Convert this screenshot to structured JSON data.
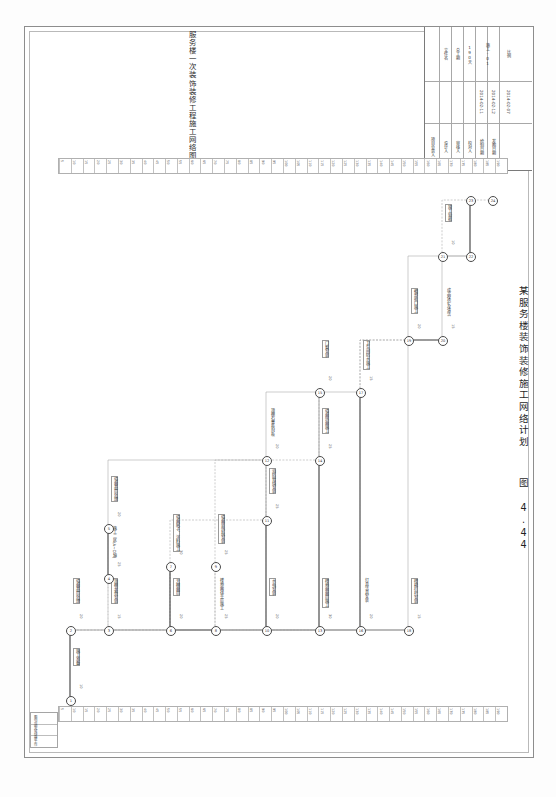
{
  "sheet": {
    "title": "服务楼一次装饰装修工程施工网络图",
    "figure_caption": "某服务楼装饰装修施工网络计划",
    "figure_number": "图 4.44"
  },
  "title_block": {
    "rows": [
      {
        "label": "项目负责人",
        "value": ""
      },
      {
        "label": "设计人",
        "value": ""
      },
      {
        "label": "审核人",
        "value": ""
      },
      {
        "label": "校对人",
        "value": ""
      },
      {
        "label": "绘制日期",
        "value": "2014-02-11"
      },
      {
        "label": "发图日期",
        "value": "2014-02-12"
      }
    ],
    "fields": [
      {
        "label": "文件名",
        "value": ""
      },
      {
        "label": "总工期",
        "value": "190天"
      },
      {
        "label": "比例",
        "value": ""
      },
      {
        "label": "图号",
        "value": "施工-01"
      }
    ],
    "date_note": "2014-02-07"
  },
  "rulers": {
    "top_labels": [
      "5",
      "10",
      "15",
      "20",
      "25",
      "30",
      "35",
      "40",
      "45",
      "50",
      "55",
      "60",
      "65",
      "70",
      "75",
      "80",
      "85",
      "90",
      "95",
      "100",
      "105",
      "110",
      "115",
      "120",
      "125",
      "130",
      "135",
      "140",
      "145",
      "150",
      "155",
      "160",
      "165",
      "170",
      "175",
      "180",
      "185",
      "190"
    ],
    "bottom_labels": [
      "5",
      "10",
      "15",
      "20",
      "25",
      "30",
      "35",
      "40",
      "45",
      "50",
      "55",
      "60",
      "65",
      "70",
      "75",
      "80",
      "85",
      "90",
      "95",
      "100",
      "105",
      "110",
      "115",
      "120",
      "125",
      "130",
      "135",
      "140",
      "145",
      "150",
      "155",
      "160",
      "165",
      "170",
      "175",
      "180",
      "185",
      "190"
    ]
  },
  "legend": {
    "rows": [
      "图例说明",
      "关键线路",
      "虚工作"
    ]
  },
  "chart_data": {
    "type": "diagram",
    "diagram_kind": "construction-network-cpm",
    "title": "服务楼一次装饰装修工程施工网络图",
    "total_duration_days": 190,
    "nodes": [
      {
        "id": "1",
        "x": 40,
        "y": 540
      },
      {
        "id": "2",
        "x": 40,
        "y": 470
      },
      {
        "id": "3",
        "x": 78,
        "y": 470
      },
      {
        "id": "4",
        "x": 78,
        "y": 418
      },
      {
        "id": "5",
        "x": 78,
        "y": 368
      },
      {
        "id": "6",
        "x": 140,
        "y": 470
      },
      {
        "id": "7",
        "x": 140,
        "y": 406
      },
      {
        "id": "8",
        "x": 185,
        "y": 470
      },
      {
        "id": "9",
        "x": 185,
        "y": 406
      },
      {
        "id": "10",
        "x": 236,
        "y": 470
      },
      {
        "id": "11",
        "x": 236,
        "y": 360
      },
      {
        "id": "12",
        "x": 236,
        "y": 300
      },
      {
        "id": "13",
        "x": 289,
        "y": 470
      },
      {
        "id": "14",
        "x": 289,
        "y": 300
      },
      {
        "id": "15",
        "x": 289,
        "y": 232
      },
      {
        "id": "16",
        "x": 330,
        "y": 470
      },
      {
        "id": "17",
        "x": 330,
        "y": 232
      },
      {
        "id": "18",
        "x": 378,
        "y": 470
      },
      {
        "id": "19",
        "x": 378,
        "y": 180
      },
      {
        "id": "20",
        "x": 412,
        "y": 180
      },
      {
        "id": "21",
        "x": 412,
        "y": 96
      },
      {
        "id": "22",
        "x": 440,
        "y": 96
      },
      {
        "id": "23",
        "x": 440,
        "y": 40
      },
      {
        "id": "24",
        "x": 462,
        "y": 40
      }
    ],
    "activities": [
      {
        "name": "施工准备",
        "duration": 10
      },
      {
        "name": "墙面基层处理",
        "duration": 20
      },
      {
        "name": "顶棚龙骨安装",
        "duration": 15
      },
      {
        "name": "施工二区(A~D轴)",
        "duration": 25
      },
      {
        "name": "墙面基层处理",
        "duration": 20
      },
      {
        "name": "天棚面层",
        "duration": 20
      },
      {
        "name": "墙面腻子、涂料施工",
        "duration": 30
      },
      {
        "name": "楼地面找平层施工",
        "duration": 25
      },
      {
        "name": "墙面装饰板安装",
        "duration": 25
      },
      {
        "name": "水电安装",
        "duration": 20
      },
      {
        "name": "消防管线安装",
        "duration": 25
      },
      {
        "name": "顶棚石膏板封板",
        "duration": 20
      },
      {
        "name": "楼地面面层施工",
        "duration": 30
      },
      {
        "name": "墙面饰面施工",
        "duration": 25
      },
      {
        "name": "门窗安装",
        "duration": 20
      },
      {
        "name": "灯具洁具安装",
        "duration": 20
      },
      {
        "name": "卫生间防水施工",
        "duration": 15
      },
      {
        "name": "楼梯栏杆安装",
        "duration": 15
      },
      {
        "name": "细部收口施工",
        "duration": 20
      },
      {
        "name": "成品保护及清洁",
        "duration": 15
      },
      {
        "name": "竣工验收",
        "duration": 10
      }
    ],
    "axis": {
      "label": "施工天数 (d)",
      "min": 0,
      "max": 190,
      "tick_step": 5
    }
  }
}
